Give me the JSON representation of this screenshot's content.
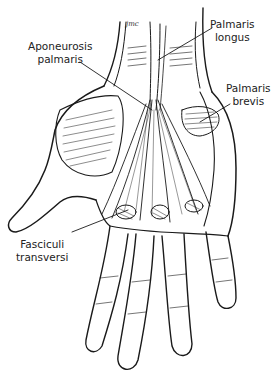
{
  "figure": {
    "signature": "jmc",
    "labels": [
      {
        "id": "aponeurosis-palmaris",
        "line1": "Aponeurosis",
        "line2": "palmaris"
      },
      {
        "id": "palmaris-longus",
        "line1": "Palmaris",
        "line2": "longus"
      },
      {
        "id": "palmaris-brevis",
        "line1": "Palmaris",
        "line2": "brevis"
      },
      {
        "id": "fasciculi-transversi",
        "line1": "Fasciculi",
        "line2": "transversi"
      }
    ],
    "colors": {
      "ink": "#1a1a1a",
      "background": "#ffffff"
    }
  }
}
